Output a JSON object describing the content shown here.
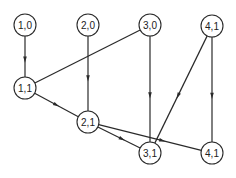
{
  "diagram": {
    "type": "directed-graph",
    "node_radius": 11,
    "colors": {
      "stroke": "#2a2a2a",
      "fill": "#ffffff",
      "text": "#222222"
    },
    "nodes": [
      {
        "id": "n10",
        "label": "1,0",
        "x": 25,
        "y": 25
      },
      {
        "id": "n20",
        "label": "2,0",
        "x": 88,
        "y": 25
      },
      {
        "id": "n30",
        "label": "3,0",
        "x": 150,
        "y": 25
      },
      {
        "id": "n41a",
        "label": "4,1",
        "x": 212,
        "y": 26
      },
      {
        "id": "n11",
        "label": "1,1",
        "x": 25,
        "y": 88
      },
      {
        "id": "n21",
        "label": "2,1",
        "x": 88,
        "y": 122
      },
      {
        "id": "n31",
        "label": "3,1",
        "x": 150,
        "y": 153
      },
      {
        "id": "n41b",
        "label": "4,1",
        "x": 212,
        "y": 153
      }
    ],
    "edges": [
      {
        "from": "n10",
        "to": "n11",
        "arrow_at": 0.55
      },
      {
        "from": "n20",
        "to": "n21",
        "arrow_at": 0.55
      },
      {
        "from": "n30",
        "to": "n31",
        "arrow_at": 0.55
      },
      {
        "from": "n41a",
        "to": "n41b",
        "arrow_at": 0.55
      },
      {
        "from": "n30",
        "to": "n11",
        "arrow_at": null
      },
      {
        "from": "n41a",
        "to": "n31",
        "arrow_at": 0.55
      },
      {
        "from": "n11",
        "to": "n21",
        "arrow_at": 0.5
      },
      {
        "from": "n21",
        "to": "n31",
        "arrow_at": 0.55
      },
      {
        "from": "n21",
        "to": "n41b",
        "arrow_at": 0.6
      }
    ]
  }
}
